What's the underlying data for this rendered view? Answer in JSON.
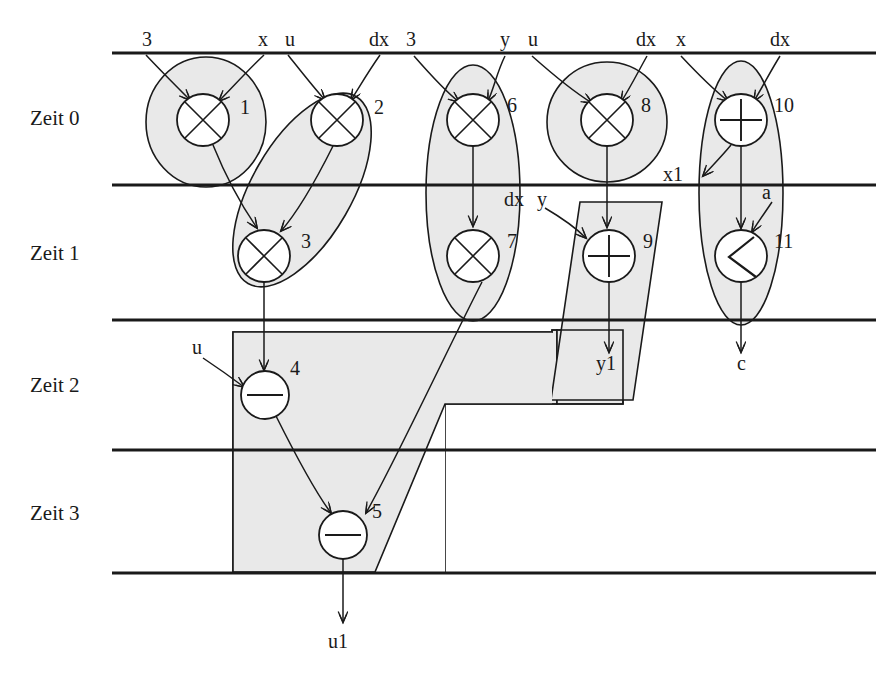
{
  "diagram": {
    "colors": {
      "stroke": "#1a1a1a",
      "shade_fill": "#e9e9e9",
      "shade_stroke": "#1a1a1a",
      "node_fill": "#ffffff",
      "background": "#ffffff"
    },
    "time_steps": [
      {
        "label": "Zeit 0",
        "x": 30,
        "y": 118
      },
      {
        "label": "Zeit 1",
        "x": 30,
        "y": 253
      },
      {
        "label": "Zeit 2",
        "x": 30,
        "y": 385
      },
      {
        "label": "Zeit 3",
        "x": 30,
        "y": 513
      }
    ],
    "separator_lines_y": [
      53,
      185,
      320,
      450,
      573
    ],
    "separator_x_start": 112,
    "separator_x_end": 876,
    "inputs": [
      {
        "label": "3",
        "x": 142,
        "y": 44
      },
      {
        "label": "x",
        "x": 258,
        "y": 44
      },
      {
        "label": "u",
        "x": 285,
        "y": 44
      },
      {
        "label": "dx",
        "x": 374,
        "y": 44
      },
      {
        "label": "3",
        "x": 406,
        "y": 44
      },
      {
        "label": "y",
        "x": 500,
        "y": 44
      },
      {
        "label": "u",
        "x": 528,
        "y": 44
      },
      {
        "label": "dx",
        "x": 641,
        "y": 44
      },
      {
        "label": "x",
        "x": 676,
        "y": 44
      },
      {
        "label": "dx",
        "x": 775,
        "y": 44
      }
    ],
    "intermediate_labels": [
      {
        "label": "x1",
        "x": 663,
        "y": 180
      },
      {
        "label": "a",
        "x": 762,
        "y": 196
      },
      {
        "label": "dx",
        "x": 508,
        "y": 204
      },
      {
        "label": "y",
        "x": 537,
        "y": 204
      },
      {
        "label": "u",
        "x": 196,
        "y": 350
      }
    ],
    "outputs": [
      {
        "label": "y1",
        "x": 602,
        "y": 364
      },
      {
        "label": "c",
        "x": 742,
        "y": 364
      },
      {
        "label": "u1",
        "x": 334,
        "y": 642
      }
    ],
    "operations": [
      {
        "id": 1,
        "op": "x",
        "symbol": "×",
        "cx": 203,
        "cy": 120,
        "r": 26,
        "num_x": 240,
        "num_y": 108
      },
      {
        "id": 2,
        "op": "x",
        "symbol": "×",
        "cx": 337,
        "cy": 120,
        "r": 26,
        "num_x": 374,
        "num_y": 108
      },
      {
        "id": 6,
        "op": "x",
        "symbol": "×",
        "cx": 473,
        "cy": 120,
        "r": 26,
        "num_x": 509,
        "num_y": 108
      },
      {
        "id": 8,
        "op": "x",
        "symbol": "×",
        "cx": 607,
        "cy": 120,
        "r": 26,
        "num_x": 644,
        "num_y": 108
      },
      {
        "id": 10,
        "op": "+",
        "symbol": "+",
        "cx": 741,
        "cy": 120,
        "r": 26,
        "num_x": 778,
        "num_y": 108
      },
      {
        "id": 3,
        "op": "x",
        "symbol": "×",
        "cx": 264,
        "cy": 256,
        "r": 26,
        "num_x": 301,
        "num_y": 243
      },
      {
        "id": 7,
        "op": "x",
        "symbol": "×",
        "cx": 473,
        "cy": 256,
        "r": 26,
        "num_x": 509,
        "num_y": 243
      },
      {
        "id": 9,
        "op": "+",
        "symbol": "+",
        "cx": 609,
        "cy": 256,
        "r": 26,
        "num_x": 645,
        "num_y": 243
      },
      {
        "id": 11,
        "op": "<",
        "symbol": "<",
        "cx": 741,
        "cy": 256,
        "r": 26,
        "num_x": 778,
        "num_y": 243
      },
      {
        "id": 4,
        "op": "-",
        "symbol": "−",
        "cx": 265,
        "cy": 395,
        "r": 24,
        "num_x": 292,
        "num_y": 369
      },
      {
        "id": 5,
        "op": "-",
        "symbol": "−",
        "cx": 343,
        "cy": 535,
        "r": 24,
        "num_x": 376,
        "num_y": 513
      }
    ],
    "resource_groups": [
      {
        "name": "multiplier-group-1",
        "shape": "ellipse",
        "members": [
          1
        ]
      },
      {
        "name": "multiplier-group-23",
        "shape": "slanted-ellipse",
        "members": [
          2,
          3
        ]
      },
      {
        "name": "multiplier-group-67",
        "shape": "tall-ellipse",
        "members": [
          6,
          7
        ]
      },
      {
        "name": "multiplier-group-8",
        "shape": "circle",
        "members": [
          8
        ]
      },
      {
        "name": "alu-group-1011",
        "shape": "tall-ellipse",
        "members": [
          10,
          11
        ]
      },
      {
        "name": "adder-group-9",
        "shape": "parallelogram",
        "members": [
          9
        ]
      },
      {
        "name": "subtractor-group-45",
        "shape": "stepped-polygon",
        "members": [
          4,
          5
        ]
      }
    ]
  }
}
